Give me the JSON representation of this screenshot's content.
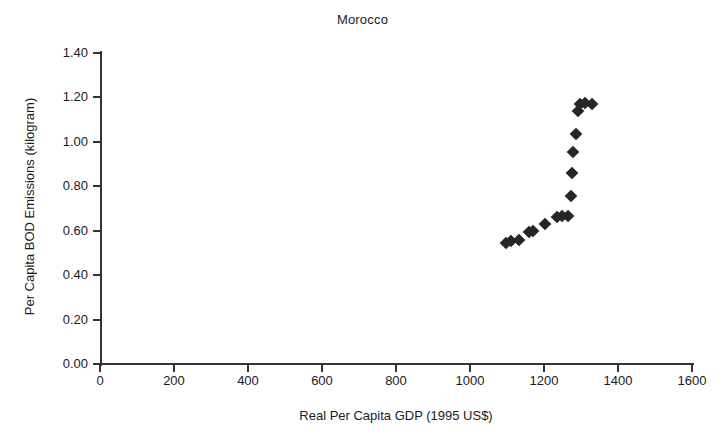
{
  "chart_data": {
    "type": "scatter",
    "title": "Morocco",
    "xlabel": "Real Per Capita GDP (1995 US$)",
    "ylabel": "Per Capita BOD Emissions (kilogram)",
    "xlim": [
      0,
      1600
    ],
    "ylim": [
      0.0,
      1.4
    ],
    "xticks": [
      0,
      200,
      400,
      600,
      800,
      1000,
      1200,
      1400,
      1600
    ],
    "xtick_labels": [
      "0",
      "200",
      "400",
      "600",
      "800",
      "1000",
      "1200",
      "1400",
      "1600"
    ],
    "yticks": [
      0.0,
      0.2,
      0.4,
      0.6,
      0.8,
      1.0,
      1.2,
      1.4
    ],
    "ytick_labels": [
      "0.00",
      "0.20",
      "0.40",
      "0.60",
      "0.80",
      "1.00",
      "1.20",
      "1.40"
    ],
    "grid": false,
    "legend": false,
    "marker": "diamond",
    "marker_color": "#262626",
    "series": [
      {
        "name": "Morocco",
        "points": [
          {
            "x": 1097,
            "y": 0.545
          },
          {
            "x": 1112,
            "y": 0.552
          },
          {
            "x": 1133,
            "y": 0.558
          },
          {
            "x": 1160,
            "y": 0.594
          },
          {
            "x": 1170,
            "y": 0.6
          },
          {
            "x": 1203,
            "y": 0.63
          },
          {
            "x": 1236,
            "y": 0.662
          },
          {
            "x": 1248,
            "y": 0.665
          },
          {
            "x": 1265,
            "y": 0.668
          },
          {
            "x": 1272,
            "y": 0.755
          },
          {
            "x": 1276,
            "y": 0.858
          },
          {
            "x": 1278,
            "y": 0.955
          },
          {
            "x": 1286,
            "y": 1.035
          },
          {
            "x": 1292,
            "y": 1.14
          },
          {
            "x": 1296,
            "y": 1.172
          },
          {
            "x": 1310,
            "y": 1.175
          },
          {
            "x": 1330,
            "y": 1.17
          }
        ]
      }
    ]
  }
}
